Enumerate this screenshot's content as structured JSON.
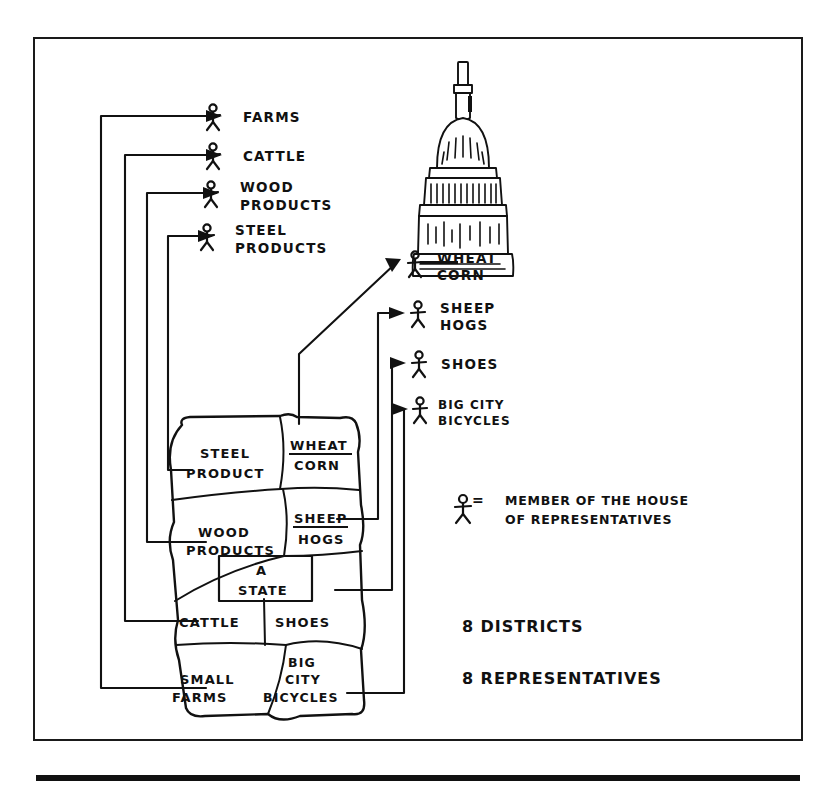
{
  "frame": {
    "border_color": "#1a1a1a"
  },
  "capitol": {
    "name": "capitol-dome"
  },
  "left_labels": [
    {
      "id": "farms",
      "lines": [
        "FARMS"
      ]
    },
    {
      "id": "cattle",
      "lines": [
        "CATTLE"
      ]
    },
    {
      "id": "wood-products",
      "lines": [
        "WOOD",
        "PRODUCTS"
      ]
    },
    {
      "id": "steel-products",
      "lines": [
        "STEEL",
        "PRODUCTS"
      ]
    }
  ],
  "right_labels": [
    {
      "id": "wheat-corn",
      "lines": [
        "WHEAT",
        "CORN"
      ]
    },
    {
      "id": "sheep-hogs",
      "lines": [
        "SHEEP",
        "HOGS"
      ]
    },
    {
      "id": "shoes",
      "lines": [
        "SHOES"
      ]
    },
    {
      "id": "big-city-bicycles",
      "lines": [
        "BIG CITY",
        "BICYCLES"
      ]
    }
  ],
  "map": {
    "center_box": {
      "lines": [
        "A",
        "STATE"
      ]
    },
    "districts": [
      {
        "id": "steel-product",
        "lines": [
          "STEEL",
          "PRODUCT"
        ],
        "underline": false
      },
      {
        "id": "wheat-corn",
        "lines": [
          "WHEAT",
          "CORN"
        ],
        "underline": true
      },
      {
        "id": "wood-products",
        "lines": [
          "WOOD",
          "PRODUCTS"
        ],
        "underline": false
      },
      {
        "id": "sheep-hogs",
        "lines": [
          "SHEEP",
          "HOGS"
        ],
        "underline": true
      },
      {
        "id": "cattle",
        "lines": [
          "CATTLE"
        ],
        "underline": false
      },
      {
        "id": "shoes",
        "lines": [
          "SHOES"
        ],
        "underline": false
      },
      {
        "id": "small-farms",
        "lines": [
          "SMALL",
          "FARMS"
        ],
        "underline": false
      },
      {
        "id": "big-city-bicycles",
        "lines": [
          "BIG",
          "CITY",
          "BICYCLES"
        ],
        "underline": false
      }
    ]
  },
  "legend": {
    "symbol": "stick-figure",
    "equals": "=",
    "lines": [
      "MEMBER OF THE HOUSE",
      "OF REPRESENTATIVES"
    ]
  },
  "counts": {
    "districts": "8 DISTRICTS",
    "representatives": "8 REPRESENTATIVES"
  }
}
